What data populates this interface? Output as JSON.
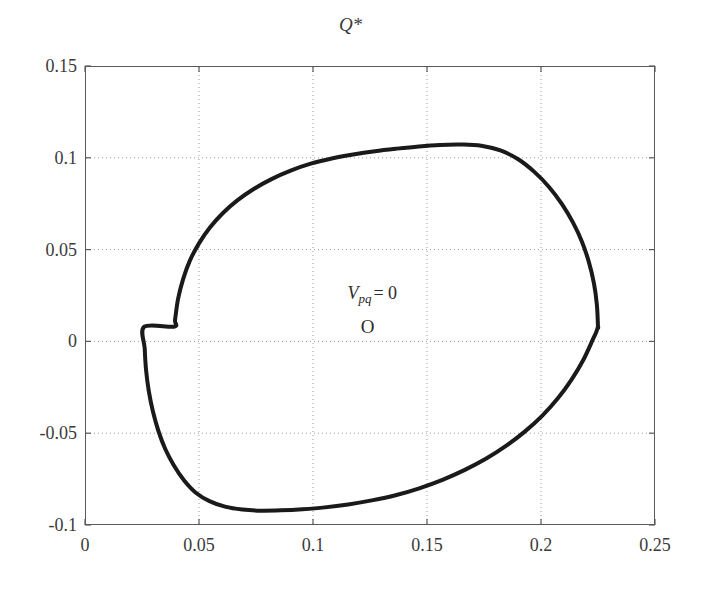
{
  "chart_data": {
    "type": "line",
    "title": "",
    "subtitle": "",
    "xlabel": "P*",
    "ylabel": "Q*",
    "xlim": [
      0,
      0.25
    ],
    "ylim": [
      -0.1,
      0.15
    ],
    "grid": true,
    "grid_style": "dotted",
    "legend": "none",
    "x_ticks": [
      "0",
      "0.05",
      "0.1",
      "0.15",
      "0.2",
      "0.25"
    ],
    "x_tick_values": [
      0,
      0.05,
      0.1,
      0.15,
      0.2,
      0.25
    ],
    "y_ticks": [
      "0.15",
      "0.1",
      "0.05",
      "0",
      "-0.05",
      "-0.1"
    ],
    "y_tick_values": [
      0.15,
      0.1,
      0.05,
      0,
      -0.05,
      -0.1
    ],
    "series": [
      {
        "name": "Vpq = 0 boundary",
        "closed": true,
        "color": "#1a1a1a",
        "line_width": 4,
        "x": [
          0.225,
          0.2245,
          0.2232,
          0.221,
          0.218,
          0.214,
          0.2092,
          0.2036,
          0.1972,
          0.19,
          0.1822,
          0.1738,
          0.165,
          0.1558,
          0.1464,
          0.1368,
          0.1272,
          0.1176,
          0.1082,
          0.099,
          0.0902,
          0.0818,
          0.074,
          0.0668,
          0.0604,
          0.0548,
          0.05,
          0.046,
          0.043,
          0.0408,
          0.0395,
          0.039,
          0.026,
          0.0262,
          0.0268,
          0.028,
          0.0298,
          0.0322,
          0.0352,
          0.039,
          0.0434,
          0.0486,
          0.0546,
          0.0614,
          0.069,
          0.0772,
          0.086,
          0.0954,
          0.1052,
          0.1154,
          0.1258,
          0.1362,
          0.1466,
          0.1568,
          0.1666,
          0.176,
          0.1848,
          0.193,
          0.2006,
          0.2074,
          0.2134,
          0.2186,
          0.2228,
          0.2242,
          0.225
        ],
        "y": [
          0.008,
          0.02,
          0.0318,
          0.0432,
          0.0542,
          0.0648,
          0.0748,
          0.084,
          0.0922,
          0.0992,
          0.104,
          0.1066,
          0.1072,
          0.107,
          0.1062,
          0.105,
          0.1036,
          0.1018,
          0.0996,
          0.0968,
          0.093,
          0.0884,
          0.083,
          0.0768,
          0.0698,
          0.062,
          0.0534,
          0.044,
          0.0338,
          0.023,
          0.0118,
          0.008,
          0.008,
          -0.004,
          -0.0158,
          -0.0272,
          -0.0382,
          -0.0488,
          -0.0586,
          -0.0676,
          -0.0756,
          -0.0824,
          -0.087,
          -0.09,
          -0.0916,
          -0.0922,
          -0.092,
          -0.0914,
          -0.0904,
          -0.0888,
          -0.0866,
          -0.0838,
          -0.08,
          -0.0754,
          -0.07,
          -0.0638,
          -0.0568,
          -0.049,
          -0.0404,
          -0.031,
          -0.0208,
          -0.01,
          0.0012,
          0.005,
          0.008
        ],
        "extents": {
          "x_min": 0.026,
          "x_max": 0.225,
          "y_min": -0.092,
          "y_max": 0.107
        }
      }
    ],
    "annotations": [
      {
        "name": "vpq-equals-zero",
        "text": "Vpq = 0",
        "symbol": "V",
        "subscript": "pq",
        "equals": "= 0",
        "x": 0.126,
        "y": 0.0255
      },
      {
        "name": "origin-marker",
        "text": "O",
        "x": 0.124,
        "y": 0.008
      }
    ]
  },
  "colors": {
    "curve": "#1a1a1a",
    "frame": "#5a5a5a",
    "grid": "#9a9a9a",
    "text": "#3a3a3a",
    "background": "#ffffff"
  }
}
